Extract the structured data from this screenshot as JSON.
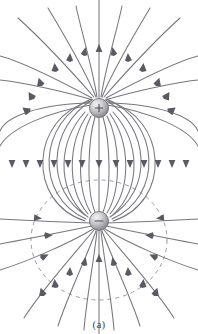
{
  "figure": {
    "caption": "(a)",
    "type": "physics-field-line-diagram"
  },
  "colors": {
    "field_line": "#77777d",
    "arrow": "#5a5a62",
    "dashed_surface": "#9a9aa0",
    "sphere_light": "#e8e8ea",
    "sphere_mid": "#b6b6bb",
    "sphere_dark": "#8a8a90",
    "sphere_edge": "#6e6e74",
    "sign_glyph": "#4a4a50",
    "background": "#ffffff",
    "caption_text": "#4a4a4a"
  },
  "charges": [
    {
      "name": "positive-charge",
      "sign": "+",
      "cx": 99,
      "cy": 108,
      "r": 9.5,
      "label": "positive point charge"
    },
    {
      "name": "negative-charge",
      "sign": "−",
      "cx": 99,
      "cy": 221,
      "r": 9.5,
      "label": "negative point charge"
    }
  ],
  "dashed_surface": {
    "name": "gaussian-surface",
    "shape": "ellipse",
    "cx": 99,
    "cy": 240,
    "rx": 68,
    "ry": 60,
    "dash": "4 4",
    "label": "dashed closed surface around negative charge"
  },
  "chart_data": {
    "type": "line",
    "xlabel": "",
    "ylabel": "",
    "annotations": [
      "(a)"
    ],
    "legend": [],
    "grid": false,
    "series": [
      {
        "name": "dipole-field-line-pair-1",
        "values": []
      },
      {
        "name": "dipole-field-line-pair-2",
        "values": []
      },
      {
        "name": "dipole-field-line-pair-3",
        "values": []
      },
      {
        "name": "dipole-field-line-pair-4",
        "values": []
      },
      {
        "name": "dipole-field-line-pair-5",
        "values": []
      },
      {
        "name": "dipole-field-line-pair-6",
        "values": []
      },
      {
        "name": "escaping-field-lines",
        "values": []
      },
      {
        "name": "dashed-gaussian-surface",
        "values": []
      }
    ]
  },
  "geometry": {
    "viewbox": "0 0 198 334",
    "axis_x": 99,
    "top_y": 108,
    "bottom_y": 221,
    "loop_widths": [
      12,
      26,
      40,
      53,
      65,
      76,
      85
    ],
    "mid_arrow_y": 165,
    "mid_arrow_count": 13
  }
}
